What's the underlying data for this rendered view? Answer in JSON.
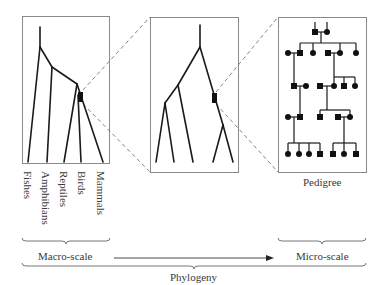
{
  "diagram": {
    "taxa_labels": [
      "Fishes",
      "Amphibians",
      "Reptiles",
      "Birds",
      "Mammals"
    ],
    "pedigree_label": "Pedigree",
    "macro_label": "Macro-scale",
    "micro_label": "Micro-scale",
    "phylogeny_label": "Phylogeny",
    "colors": {
      "line": "#1a1a1a",
      "box": "#888888",
      "dash": "#777777",
      "text": "#3a3a3a"
    }
  }
}
